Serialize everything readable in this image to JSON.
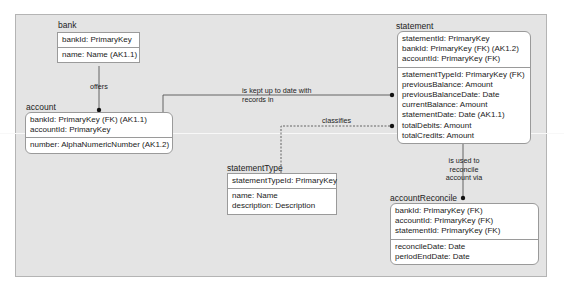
{
  "diagram": {
    "type": "IDEF1X entity-relationship diagram",
    "entities": [
      {
        "name": "bank",
        "key_attributes": [
          "bankId: PrimaryKey"
        ],
        "attributes": [
          "name: Name (AK1.1)"
        ]
      },
      {
        "name": "account",
        "key_attributes": [
          "bankId: PrimaryKey (FK) (AK1.1)",
          "accountId: PrimaryKey"
        ],
        "attributes": [
          "number: AlphaNumericNumber (AK1.2)"
        ]
      },
      {
        "name": "statement",
        "key_attributes": [
          "statementId: PrimaryKey",
          "bankId: PrimaryKey (FK) (AK1.2)",
          "accountId: PrimaryKey (FK)"
        ],
        "attributes": [
          "statementTypeId: PrimaryKey (FK)",
          "previousBalance: Amount",
          "previousBalanceDate: Date",
          "currentBalance: Amount",
          "statementDate: Date (AK1.1)",
          "totalDebits: Amount",
          "totalCredits: Amount"
        ]
      },
      {
        "name": "statementType",
        "key_attributes": [
          "statementTypeId: PrimaryKey"
        ],
        "attributes": [
          "name: Name",
          "description: Description"
        ]
      },
      {
        "name": "accountReconcile",
        "key_attributes": [
          "bankId: PrimaryKey (FK)",
          "accountId: PrimaryKey (FK)",
          "statementId: PrimaryKey (FK)"
        ],
        "attributes": [
          "reconcileDate: Date",
          "periodEndDate: Date"
        ]
      }
    ],
    "relationships": [
      {
        "from": "bank",
        "to": "account",
        "label_lines": [
          "offers"
        ],
        "style": "solid"
      },
      {
        "from": "account",
        "to": "statement",
        "label_lines": [
          "is kept up to date with",
          "records in"
        ],
        "style": "solid"
      },
      {
        "from": "statementType",
        "to": "statement",
        "label_lines": [
          "classifies"
        ],
        "style": "dashed"
      },
      {
        "from": "statement",
        "to": "accountReconcile",
        "label_lines": [
          "is used to",
          "reconcile",
          "account via"
        ],
        "style": "solid"
      }
    ],
    "colors": {
      "canvas": "#e4e4e4",
      "entity_fill": "#ffffff",
      "border": "#9a9a9a",
      "line": "#555555"
    }
  }
}
